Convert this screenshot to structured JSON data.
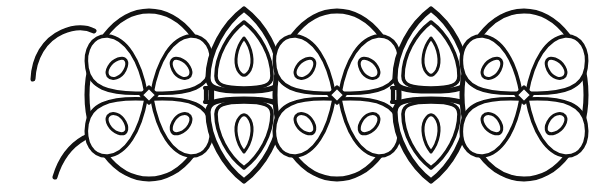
{
  "figure": {
    "title": "Filamentous green alga line drawing",
    "subject_name": "algal-filament",
    "style": "hand-drawn ink line art",
    "background_color": "#ffffff",
    "ink_color": "#121212",
    "canvas_width": 614,
    "canvas_height": 184,
    "has_labels": false,
    "has_scale_bar": false,
    "has_text": false,
    "caption": ""
  },
  "filament": {
    "orientation": "horizontal",
    "cell_count": 5,
    "partial_cell_right": true,
    "broken_wall_left": true,
    "midline_y": 95,
    "cells": [
      {
        "index": 1,
        "name": "cell-round-1",
        "type": "round",
        "center_x": 149,
        "center_y": 95,
        "radius_x": 62,
        "radius_y": 84,
        "chloroplast_count": 4,
        "pyrenoid_count": 4,
        "has_nucleus": true
      },
      {
        "index": 2,
        "name": "cell-narrow-2",
        "type": "fusiform",
        "center_x": 244,
        "center_y": 95,
        "radius_x": 36,
        "radius_y": 86,
        "chloroplast_count": 2,
        "pyrenoid_count": 2,
        "has_nucleus": false
      },
      {
        "index": 3,
        "name": "cell-round-3",
        "type": "round",
        "center_x": 337,
        "center_y": 95,
        "radius_x": 62,
        "radius_y": 84,
        "chloroplast_count": 4,
        "pyrenoid_count": 4,
        "has_nucleus": true
      },
      {
        "index": 4,
        "name": "cell-narrow-4",
        "type": "fusiform",
        "center_x": 431,
        "center_y": 95,
        "radius_x": 36,
        "radius_y": 86,
        "chloroplast_count": 2,
        "pyrenoid_count": 2,
        "has_nucleus": false
      },
      {
        "index": 5,
        "name": "cell-round-5",
        "type": "round",
        "center_x": 524,
        "center_y": 95,
        "radius_x": 62,
        "radius_y": 84,
        "chloroplast_count": 4,
        "pyrenoid_count": 4,
        "has_nucleus": true
      }
    ],
    "isthmus_joints": [
      {
        "name": "isthmus-1",
        "x": 207,
        "y": 95
      },
      {
        "name": "isthmus-2",
        "x": 280,
        "y": 95
      },
      {
        "name": "isthmus-3",
        "x": 394,
        "y": 95
      },
      {
        "name": "isthmus-4",
        "x": 468,
        "y": 95
      }
    ],
    "left_tails": [
      {
        "name": "tail-upper-left",
        "from_x": 33,
        "from_y": 78,
        "to_x": 92,
        "to_y": 30
      },
      {
        "name": "tail-lower-left",
        "from_x": 55,
        "from_y": 176,
        "to_x": 99,
        "to_y": 133
      }
    ],
    "right_overlap_arc": {
      "name": "overlap-arc-right",
      "center_x": 552,
      "center_y": 97,
      "radius_x": 44,
      "radius_y": 72
    }
  }
}
